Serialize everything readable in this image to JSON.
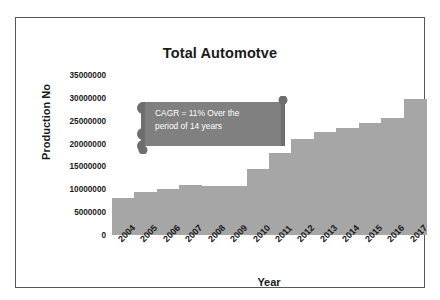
{
  "chart_data": {
    "type": "bar",
    "title": "Total Automotve",
    "xlabel": "Year",
    "ylabel": "Production No",
    "categories": [
      "2004",
      "2005",
      "2006",
      "2007",
      "2008",
      "2009",
      "2010",
      "2011",
      "2012",
      "2013",
      "2014",
      "2015",
      "2016",
      "2017"
    ],
    "values": [
      8000000,
      9500000,
      10000000,
      11000000,
      10800000,
      10800000,
      14500000,
      18000000,
      21000000,
      22500000,
      23500000,
      24500000,
      25500000,
      29800000
    ],
    "ytick_labels": [
      "35000000",
      "30000000",
      "25000000",
      "20000000",
      "15000000",
      "10000000",
      "5000000",
      "0"
    ],
    "ytick_values": [
      35000000,
      30000000,
      25000000,
      20000000,
      15000000,
      10000000,
      5000000,
      0
    ],
    "ylim": [
      0,
      35000000
    ],
    "grid": false,
    "legend": false,
    "bar_color": "#a6a6a6",
    "annotations": [
      {
        "name": "cagr-callout",
        "line1": "CAGR = 11% Over the",
        "line2": "period of 14 years",
        "shape": "horizontal-scroll",
        "fill": "#808080",
        "text_color": "#ffffff"
      }
    ]
  },
  "frame": {
    "border_color": "#58585a"
  }
}
